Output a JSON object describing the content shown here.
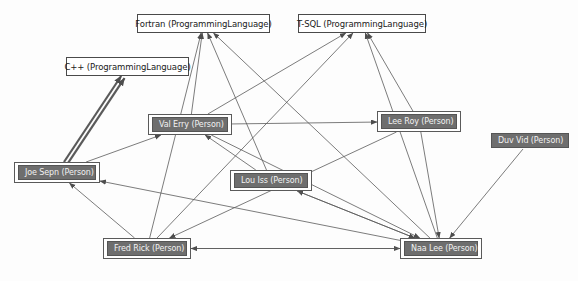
{
  "diagram": {
    "background_color": "#fdfdfd",
    "edge_color": "#5a5a5a",
    "person_fill": "#6e6e6e",
    "person_text": "#f2f2f2",
    "language_fill": "#ffffff",
    "language_text": "#1a1a1a",
    "nodes": [
      {
        "id": "fortran",
        "label": "Fortran (ProgrammingLanguage)",
        "type": "language",
        "x": 137,
        "y": 14,
        "w": 133,
        "h": 19
      },
      {
        "id": "tsql",
        "label": "T-SQL (ProgrammingLanguage)",
        "type": "language",
        "x": 298,
        "y": 14,
        "w": 128,
        "h": 19
      },
      {
        "id": "cpp",
        "label": "C++ (ProgrammingLanguage)",
        "type": "language",
        "x": 66,
        "y": 57,
        "w": 123,
        "h": 19
      },
      {
        "id": "val_erry",
        "label": "Val Erry (Person)",
        "type": "person",
        "x": 148,
        "y": 114,
        "w": 84,
        "h": 21
      },
      {
        "id": "lee_roy",
        "label": "Lee Roy (Person)",
        "type": "person",
        "x": 377,
        "y": 111,
        "w": 84,
        "h": 21
      },
      {
        "id": "duv_vid",
        "label": "Duv Vid (Person)",
        "type": "person",
        "x": 491,
        "y": 132,
        "w": 78,
        "h": 17,
        "framed": false
      },
      {
        "id": "joe_sepn",
        "label": "Joe Sepn (Person)",
        "type": "person",
        "x": 14,
        "y": 162,
        "w": 86,
        "h": 21
      },
      {
        "id": "lou_iss",
        "label": "Lou Iss (Person)",
        "type": "person",
        "x": 230,
        "y": 170,
        "w": 82,
        "h": 21
      },
      {
        "id": "fred_rick",
        "label": "Fred Rick (Person)",
        "type": "person",
        "x": 103,
        "y": 238,
        "w": 88,
        "h": 21
      },
      {
        "id": "naa_lee",
        "label": "Naa Lee (Person)",
        "type": "person",
        "x": 400,
        "y": 238,
        "w": 82,
        "h": 21
      }
    ],
    "edges": [
      {
        "from": "joe_sepn",
        "to": "cpp",
        "style": "thick"
      },
      {
        "from": "joe_sepn",
        "to": "cpp",
        "style": "thick-parallel"
      },
      {
        "from": "val_erry",
        "to": "fortran",
        "style": "thin"
      },
      {
        "from": "naa_lee",
        "to": "fortran",
        "style": "thin"
      },
      {
        "from": "fred_rick",
        "to": "fortran",
        "style": "thin"
      },
      {
        "from": "lou_iss",
        "to": "fortran",
        "style": "thin"
      },
      {
        "from": "val_erry",
        "to": "tsql",
        "style": "thin"
      },
      {
        "from": "lee_roy",
        "to": "tsql",
        "style": "thin"
      },
      {
        "from": "fred_rick",
        "to": "tsql",
        "style": "thin"
      },
      {
        "from": "naa_lee",
        "to": "tsql",
        "style": "thin"
      },
      {
        "from": "val_erry",
        "to": "lee_roy",
        "style": "thin"
      },
      {
        "from": "joe_sepn",
        "to": "val_erry",
        "style": "thin"
      },
      {
        "from": "lou_iss",
        "to": "val_erry",
        "style": "thin"
      },
      {
        "from": "fred_rick",
        "to": "joe_sepn",
        "style": "thin"
      },
      {
        "from": "naa_lee",
        "to": "joe_sepn",
        "style": "thin"
      },
      {
        "from": "naa_lee",
        "to": "lou_iss",
        "style": "thin"
      },
      {
        "from": "fred_rick",
        "to": "naa_lee",
        "style": "thin"
      },
      {
        "from": "lou_iss",
        "to": "naa_lee",
        "style": "thin"
      },
      {
        "from": "val_erry",
        "to": "naa_lee",
        "style": "thin"
      },
      {
        "from": "duv_vid",
        "to": "naa_lee",
        "style": "thin"
      },
      {
        "from": "lee_roy",
        "to": "naa_lee",
        "style": "thin"
      },
      {
        "from": "naa_lee",
        "to": "fred_rick",
        "style": "thin"
      },
      {
        "from": "lee_roy",
        "to": "fred_rick",
        "style": "thin"
      }
    ]
  }
}
